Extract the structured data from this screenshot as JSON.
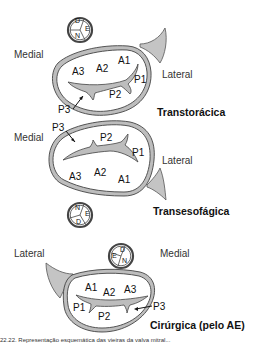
{
  "colors": {
    "ring_fill": "#bdbdbd",
    "ring_stroke": "#444444",
    "appendage_fill": "#c4c4c4",
    "background": "#ffffff"
  },
  "views": [
    {
      "name": "Transtorácica",
      "labels": {
        "left": "Medial",
        "right": "Lateral"
      },
      "orientation_icon": {
        "top": "D",
        "bottom": "N",
        "side": "E"
      },
      "segments": {
        "A1": "A1",
        "A2": "A2",
        "A3": "A3",
        "P1": "P1",
        "P2": "P2",
        "P3": "P3"
      }
    },
    {
      "name": "Transesofágica",
      "labels": {
        "left": "Medial",
        "right": "Lateral"
      },
      "orientation_icon": {
        "top": "N",
        "bottom": "D",
        "side": "E"
      },
      "segments": {
        "A1": "A1",
        "A2": "A2",
        "A3": "A3",
        "P1": "P1",
        "P2": "P2",
        "P3": "P3"
      }
    },
    {
      "name": "Cirúrgica (pelo AE)",
      "labels": {
        "left": "Lateral",
        "right": "Medial"
      },
      "orientation_icon": {
        "top": "D",
        "bottom": "N",
        "side": "E"
      },
      "segments": {
        "A1": "A1",
        "A2": "A2",
        "A3": "A3",
        "P1": "P1",
        "P2": "P2",
        "P3": "P3"
      }
    }
  ],
  "caption": "22.22. Representação esquemática das vieiras da valva mitral..."
}
